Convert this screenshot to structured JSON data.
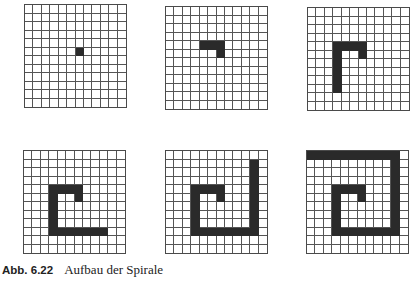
{
  "figure": {
    "caption_number": "Abb. 6.22",
    "caption_text": "Aufbau der Spirale",
    "grid_size": {
      "rows": 12,
      "cols": 12
    },
    "fill_color": "#2a2a2a",
    "line_color": "#555555",
    "steps": [
      {
        "id": "g1",
        "filled": [
          [
            5,
            6
          ]
        ]
      },
      {
        "id": "g2",
        "filled": [
          [
            4,
            4
          ],
          [
            4,
            5
          ],
          [
            4,
            6
          ],
          [
            5,
            6
          ]
        ]
      },
      {
        "id": "g3",
        "filled": [
          [
            4,
            3
          ],
          [
            4,
            4
          ],
          [
            4,
            5
          ],
          [
            4,
            6
          ],
          [
            5,
            6
          ],
          [
            5,
            3
          ],
          [
            6,
            3
          ],
          [
            7,
            3
          ],
          [
            8,
            3
          ],
          [
            9,
            3
          ]
        ]
      },
      {
        "id": "g4",
        "filled": [
          [
            4,
            3
          ],
          [
            4,
            4
          ],
          [
            4,
            5
          ],
          [
            4,
            6
          ],
          [
            5,
            6
          ],
          [
            5,
            3
          ],
          [
            6,
            3
          ],
          [
            7,
            3
          ],
          [
            8,
            3
          ],
          [
            9,
            3
          ],
          [
            9,
            4
          ],
          [
            9,
            5
          ],
          [
            9,
            6
          ],
          [
            9,
            7
          ],
          [
            9,
            8
          ],
          [
            9,
            9
          ]
        ]
      },
      {
        "id": "g5",
        "filled": [
          [
            4,
            3
          ],
          [
            4,
            4
          ],
          [
            4,
            5
          ],
          [
            4,
            6
          ],
          [
            5,
            6
          ],
          [
            5,
            3
          ],
          [
            6,
            3
          ],
          [
            7,
            3
          ],
          [
            8,
            3
          ],
          [
            9,
            3
          ],
          [
            9,
            4
          ],
          [
            9,
            5
          ],
          [
            9,
            6
          ],
          [
            9,
            7
          ],
          [
            9,
            8
          ],
          [
            9,
            9
          ],
          [
            9,
            10
          ],
          [
            8,
            10
          ],
          [
            7,
            10
          ],
          [
            6,
            10
          ],
          [
            5,
            10
          ],
          [
            4,
            10
          ],
          [
            3,
            10
          ],
          [
            2,
            10
          ],
          [
            1,
            10
          ]
        ]
      },
      {
        "id": "g6",
        "filled": [
          [
            4,
            3
          ],
          [
            4,
            4
          ],
          [
            4,
            5
          ],
          [
            4,
            6
          ],
          [
            5,
            6
          ],
          [
            5,
            3
          ],
          [
            6,
            3
          ],
          [
            7,
            3
          ],
          [
            8,
            3
          ],
          [
            9,
            3
          ],
          [
            9,
            4
          ],
          [
            9,
            5
          ],
          [
            9,
            6
          ],
          [
            9,
            7
          ],
          [
            9,
            8
          ],
          [
            9,
            9
          ],
          [
            9,
            10
          ],
          [
            8,
            10
          ],
          [
            7,
            10
          ],
          [
            6,
            10
          ],
          [
            5,
            10
          ],
          [
            4,
            10
          ],
          [
            3,
            10
          ],
          [
            2,
            10
          ],
          [
            1,
            10
          ],
          [
            0,
            10
          ],
          [
            0,
            9
          ],
          [
            0,
            8
          ],
          [
            0,
            7
          ],
          [
            0,
            6
          ],
          [
            0,
            5
          ],
          [
            0,
            4
          ],
          [
            0,
            3
          ],
          [
            0,
            2
          ],
          [
            0,
            1
          ],
          [
            0,
            0
          ]
        ]
      }
    ]
  }
}
